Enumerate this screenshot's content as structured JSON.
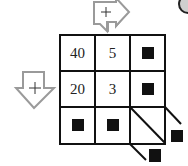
{
  "puzzle": {
    "operation_symbol": "+",
    "top_arrow": {
      "label": "+",
      "direction": "right-down"
    },
    "left_arrow": {
      "label": "+",
      "direction": "down-right"
    },
    "grid": [
      [
        "40",
        "5",
        "■"
      ],
      [
        "20",
        "3",
        "■"
      ],
      [
        "■",
        "■",
        ""
      ]
    ],
    "diagonal_answers": [
      "■",
      "■"
    ]
  },
  "colors": {
    "grid_line": "#111111",
    "arrow_outline": "#9a9a9a",
    "answer_box": "#111111"
  }
}
